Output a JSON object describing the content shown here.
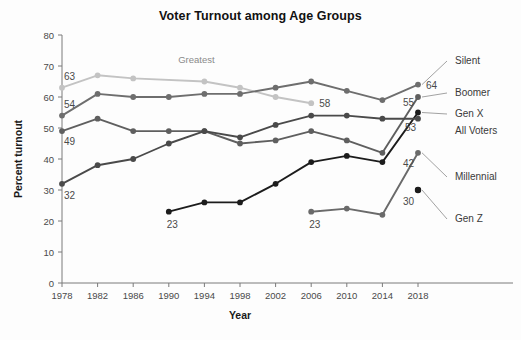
{
  "chart_data": {
    "type": "line",
    "title": "Voter Turnout among Age Groups",
    "xlabel": "Year",
    "ylabel": "Percent turnout",
    "x": [
      1978,
      1982,
      1986,
      1990,
      1994,
      1998,
      2002,
      2006,
      2010,
      2014,
      2018
    ],
    "xlim": [
      1978,
      2018
    ],
    "ylim": [
      0,
      80
    ],
    "ytick_values": [
      0,
      10,
      20,
      30,
      40,
      50,
      60,
      70,
      80
    ],
    "ytick_labels": [
      "0",
      "10",
      "20",
      "30",
      "40",
      "50",
      "60",
      "70",
      "80"
    ],
    "xtick_labels": [
      "1978",
      "1982",
      "1986",
      "1990",
      "1994",
      "1998",
      "2002",
      "2006",
      "2010",
      "2014",
      "2018"
    ],
    "grid": false,
    "legend_position": "right-inline-labels",
    "series": [
      {
        "name": "Greatest",
        "color": "#c3c3c3",
        "label_side": "inline",
        "start_year": 1978,
        "values": [
          63,
          67,
          66,
          null,
          65,
          63,
          60,
          58,
          null,
          null,
          null
        ],
        "points": [
          {
            "year": 1978,
            "value": 63
          },
          {
            "year": 1982,
            "value": 67
          },
          {
            "year": 1986,
            "value": 66
          },
          {
            "year": 1994,
            "value": 65
          },
          {
            "year": 1998,
            "value": 63
          },
          {
            "year": 2002,
            "value": 60
          },
          {
            "year": 2006,
            "value": 58
          }
        ],
        "end_label": "58",
        "end_value": 58
      },
      {
        "name": "Silent",
        "color": "#6e6e6e",
        "start_year": 1978,
        "points": [
          {
            "year": 1978,
            "value": 54
          },
          {
            "year": 1982,
            "value": 61
          },
          {
            "year": 1986,
            "value": 60
          },
          {
            "year": 1990,
            "value": 60
          },
          {
            "year": 1994,
            "value": 61
          },
          {
            "year": 1998,
            "value": 61
          },
          {
            "year": 2002,
            "value": 63
          },
          {
            "year": 2006,
            "value": 65
          },
          {
            "year": 2010,
            "value": 62
          },
          {
            "year": 2014,
            "value": 59
          },
          {
            "year": 2018,
            "value": 64
          }
        ],
        "start_label": "54",
        "end_label": "64",
        "end_value": 64
      },
      {
        "name": "Boomer",
        "color": "#5f5f5f",
        "start_year": 1978,
        "points": [
          {
            "year": 1978,
            "value": 49
          },
          {
            "year": 1982,
            "value": 53
          },
          {
            "year": 1986,
            "value": 49
          },
          {
            "year": 1990,
            "value": 49
          },
          {
            "year": 1994,
            "value": 49
          },
          {
            "year": 1998,
            "value": 45
          },
          {
            "year": 2002,
            "value": 46
          },
          {
            "year": 2006,
            "value": 49
          },
          {
            "year": 2010,
            "value": 46
          },
          {
            "year": 2014,
            "value": 42
          },
          {
            "year": 2018,
            "value": 60
          }
        ],
        "start_label": "49"
      },
      {
        "name": "Gen X",
        "color": "#1c1c1c",
        "start_year": 1990,
        "points": [
          {
            "year": 1990,
            "value": 23
          },
          {
            "year": 1994,
            "value": 26
          },
          {
            "year": 1998,
            "value": 26
          },
          {
            "year": 2002,
            "value": 32
          },
          {
            "year": 2006,
            "value": 39
          },
          {
            "year": 2010,
            "value": 41
          },
          {
            "year": 2014,
            "value": 39
          },
          {
            "year": 2018,
            "value": 55
          }
        ],
        "start_label": "23",
        "end_label": "55",
        "end_value": 55
      },
      {
        "name": "All Voters",
        "color": "#4a4a4a",
        "start_year": 1978,
        "points": [
          {
            "year": 1978,
            "value": 32
          },
          {
            "year": 1982,
            "value": 38
          },
          {
            "year": 1986,
            "value": 40
          },
          {
            "year": 1990,
            "value": 45
          },
          {
            "year": 1994,
            "value": 49
          },
          {
            "year": 1998,
            "value": 47
          },
          {
            "year": 2002,
            "value": 51
          },
          {
            "year": 2006,
            "value": 54
          },
          {
            "year": 2010,
            "value": 54
          },
          {
            "year": 2014,
            "value": 53
          },
          {
            "year": 2018,
            "value": 53
          }
        ],
        "start_label": "32",
        "end_label": "53",
        "end_value": 53
      },
      {
        "name": "Millennial",
        "color": "#6a6a6a",
        "start_year": 2006,
        "points": [
          {
            "year": 2006,
            "value": 23
          },
          {
            "year": 2010,
            "value": 24
          },
          {
            "year": 2014,
            "value": 22
          },
          {
            "year": 2018,
            "value": 42
          }
        ],
        "start_label": "23",
        "end_label": "42",
        "end_value": 42
      },
      {
        "name": "Gen Z",
        "color": "#1c1c1c",
        "start_year": 2018,
        "points": [
          {
            "year": 2018,
            "value": 30
          }
        ],
        "end_label": "30",
        "end_value": 30
      }
    ],
    "annotations": [
      {
        "text": "Greatest",
        "year": 1994,
        "value": 71
      },
      {
        "text": "58",
        "year": 2006,
        "value": 58
      },
      {
        "text": "63",
        "year": 1978,
        "value": 66
      },
      {
        "text": "54",
        "year": 1978,
        "value": 58
      },
      {
        "text": "49",
        "year": 1978,
        "value": 45
      },
      {
        "text": "32",
        "year": 1978,
        "value": 28
      },
      {
        "text": "23",
        "year": 1990,
        "value": 19
      },
      {
        "text": "23",
        "year": 2006,
        "value": 19
      }
    ]
  }
}
